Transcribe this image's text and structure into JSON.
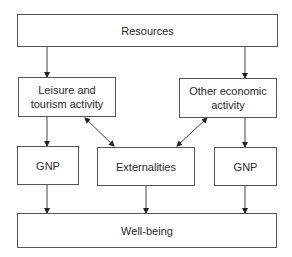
{
  "diagram": {
    "nodes": {
      "resources": "Resources",
      "leisure": "Leisure and tourism activity",
      "other": "Other economic activity",
      "gnp_left": "GNP",
      "externalities": "Externalities",
      "gnp_right": "GNP",
      "wellbeing": "Well-being"
    },
    "edges": [
      {
        "from": "resources",
        "to": "leisure",
        "type": "arrow"
      },
      {
        "from": "resources",
        "to": "other",
        "type": "arrow"
      },
      {
        "from": "leisure",
        "to": "externalities",
        "type": "bidirectional"
      },
      {
        "from": "other",
        "to": "externalities",
        "type": "bidirectional"
      },
      {
        "from": "leisure",
        "to": "gnp_left",
        "type": "arrow"
      },
      {
        "from": "other",
        "to": "gnp_right",
        "type": "arrow"
      },
      {
        "from": "gnp_left",
        "to": "wellbeing",
        "type": "arrow"
      },
      {
        "from": "externalities",
        "to": "wellbeing",
        "type": "arrow"
      },
      {
        "from": "gnp_right",
        "to": "wellbeing",
        "type": "arrow"
      }
    ]
  }
}
